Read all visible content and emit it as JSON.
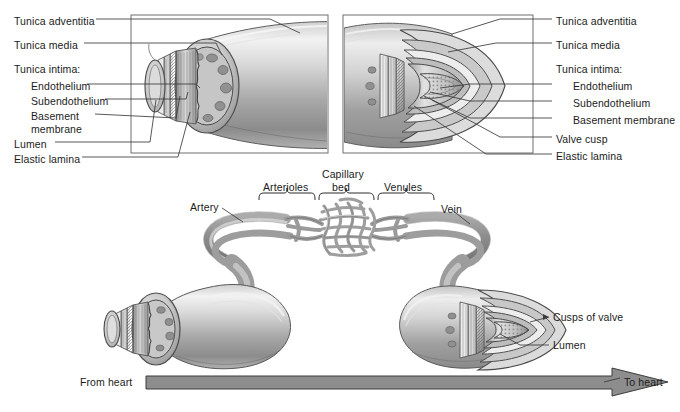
{
  "figure": {
    "type": "anatomical-diagram",
    "background_color": "#ffffff",
    "ink_color": "#1b1b1b",
    "arrow_fill": "#8d8d8d",
    "vessel_fill_light": "#e8e8e8",
    "vessel_fill_mid": "#b9b9b9",
    "vessel_fill_dark": "#8a8a8a"
  },
  "panels": {
    "artery": {
      "name": "artery-cutaway-panel",
      "frame": {
        "x": 131,
        "y": 15,
        "w": 197,
        "h": 138
      },
      "labels": [
        {
          "id": "tunica-adventitia",
          "text": "Tunica adventitia",
          "x": 14,
          "y": 15
        },
        {
          "id": "tunica-media",
          "text": "Tunica media",
          "x": 14,
          "y": 39
        },
        {
          "id": "tunica-intima-heading",
          "text": "Tunica intima:",
          "x": 14,
          "y": 63
        },
        {
          "id": "endothelium",
          "text": "Endothelium",
          "x": 31,
          "y": 80
        },
        {
          "id": "subendothelium",
          "text": "Subendothelium",
          "x": 31,
          "y": 95
        },
        {
          "id": "basement-membrane",
          "text": "Basement membrane",
          "x": 31,
          "y": 110
        },
        {
          "id": "lumen",
          "text": "Lumen",
          "x": 14,
          "y": 138
        },
        {
          "id": "elastic-lamina",
          "text": "Elastic lamina",
          "x": 14,
          "y": 153
        }
      ]
    },
    "vein": {
      "name": "vein-cutaway-panel",
      "frame": {
        "x": 343,
        "y": 15,
        "w": 190,
        "h": 138
      },
      "labels": [
        {
          "id": "tunica-adventitia",
          "text": "Tunica adventitia",
          "x": 556,
          "y": 15
        },
        {
          "id": "tunica-media",
          "text": "Tunica media",
          "x": 556,
          "y": 39
        },
        {
          "id": "tunica-intima-heading",
          "text": "Tunica intima:",
          "x": 556,
          "y": 63
        },
        {
          "id": "endothelium",
          "text": "Endothelium",
          "x": 573,
          "y": 80
        },
        {
          "id": "subendothelium",
          "text": "Subendothelium",
          "x": 573,
          "y": 97
        },
        {
          "id": "basement-membrane",
          "text": "Basement membrane",
          "x": 573,
          "y": 114
        },
        {
          "id": "valve-cusp",
          "text": "Valve cusp",
          "x": 556,
          "y": 133
        },
        {
          "id": "elastic-lamina",
          "text": "Elastic lamina",
          "x": 556,
          "y": 150
        }
      ]
    }
  },
  "microcirculation": {
    "name": "capillary-bed-diagram",
    "brackets": [
      {
        "id": "arterioles",
        "label": "Arterioles",
        "label_x": 263,
        "label_y": 181,
        "x1": 259,
        "x2": 315,
        "y": 193
      },
      {
        "id": "capillary-bed",
        "label": "Capillary",
        "label2": "bed",
        "label_x": 322,
        "label_y": 168,
        "x1": 319,
        "x2": 374,
        "y": 193
      },
      {
        "id": "venules",
        "label": "Venules",
        "label_x": 384,
        "label_y": 181,
        "x1": 378,
        "x2": 434,
        "y": 193
      }
    ],
    "vessel_labels": [
      {
        "id": "artery",
        "text": "Artery",
        "x": 190,
        "y": 206
      },
      {
        "id": "vein",
        "text": "Vein",
        "x": 441,
        "y": 206
      }
    ]
  },
  "lower": {
    "name": "valve-comparison",
    "labels": [
      {
        "id": "cusps-of-valve",
        "text": "Cusps of valve",
        "x": 553,
        "y": 313
      },
      {
        "id": "lumen",
        "text": "Lumen",
        "x": 553,
        "y": 341
      }
    ]
  },
  "flow": {
    "name": "blood-flow-arrow",
    "from_label": "From heart",
    "to_label": "To heart",
    "from_x": 80,
    "from_y": 380,
    "to_x": 624,
    "to_y": 380,
    "bar": {
      "x": 146,
      "y": 376,
      "w": 410,
      "h": 13
    },
    "head": {
      "tip_x": 612,
      "y": 382,
      "w": 56,
      "h": 30
    }
  }
}
